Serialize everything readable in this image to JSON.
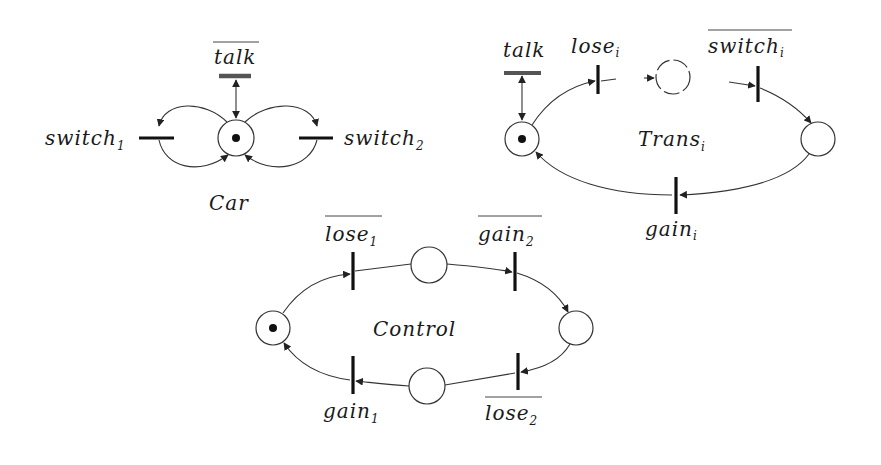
{
  "diagram": {
    "type": "petri-net",
    "nets": {
      "car": {
        "name": "Car",
        "transitions": {
          "talk": {
            "base": "talk",
            "sub": "",
            "overlined": true
          },
          "switch1": {
            "base": "switch",
            "sub": "1",
            "overlined": false
          },
          "switch2": {
            "base": "switch",
            "sub": "2",
            "overlined": false
          }
        },
        "places": [
          {
            "id": "car-place",
            "tokens": 1
          }
        ]
      },
      "trans": {
        "name": "Trans",
        "name_sub": "i",
        "transitions": {
          "talk": {
            "base": "talk",
            "sub": "",
            "overlined": false
          },
          "lose": {
            "base": "lose",
            "sub": "i",
            "overlined": false
          },
          "switch": {
            "base": "switch",
            "sub": "i",
            "overlined": true
          },
          "gain": {
            "base": "gain",
            "sub": "i",
            "overlined": false
          }
        },
        "places": [
          {
            "id": "trans-left",
            "tokens": 1
          },
          {
            "id": "trans-top",
            "tokens": 0
          },
          {
            "id": "trans-right",
            "tokens": 0
          }
        ]
      },
      "control": {
        "name": "Control",
        "transitions": {
          "lose1": {
            "base": "lose",
            "sub": "1",
            "overlined": true
          },
          "gain2": {
            "base": "gain",
            "sub": "2",
            "overlined": true
          },
          "lose2": {
            "base": "lose",
            "sub": "2",
            "overlined": true
          },
          "gain1": {
            "base": "gain",
            "sub": "1",
            "overlined": false
          }
        },
        "places": [
          {
            "id": "control-left",
            "tokens": 1
          },
          {
            "id": "control-top",
            "tokens": 0
          },
          {
            "id": "control-right",
            "tokens": 0
          },
          {
            "id": "control-bottom",
            "tokens": 0
          }
        ]
      }
    }
  }
}
